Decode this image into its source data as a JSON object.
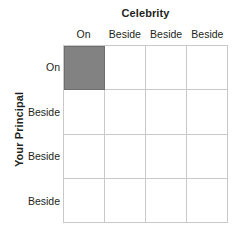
{
  "figure": {
    "column_axis_title": "Celebrity",
    "row_axis_title": "Your Principal",
    "column_headers": [
      "On",
      "Beside",
      "Beside",
      "Beside"
    ],
    "row_headers": [
      "On",
      "Beside",
      "Beside",
      "Beside"
    ],
    "colors": {
      "background": "#ffffff",
      "grid_line": "#c9c9c9",
      "shaded_cell_fill": "#828282",
      "shaded_cell_border": "#6e6e6e",
      "text": "#231f20"
    }
  },
  "chart_data": {
    "type": "heatmap",
    "title": "",
    "xlabel": "Celebrity",
    "ylabel": "Your Principal",
    "x": [
      "On",
      "Beside",
      "Beside",
      "Beside"
    ],
    "y": [
      "On",
      "Beside",
      "Beside",
      "Beside"
    ],
    "values": [
      [
        1,
        0,
        0,
        0
      ],
      [
        0,
        0,
        0,
        0
      ],
      [
        0,
        0,
        0,
        0
      ],
      [
        0,
        0,
        0,
        0
      ]
    ],
    "legend": [],
    "grid": true
  }
}
